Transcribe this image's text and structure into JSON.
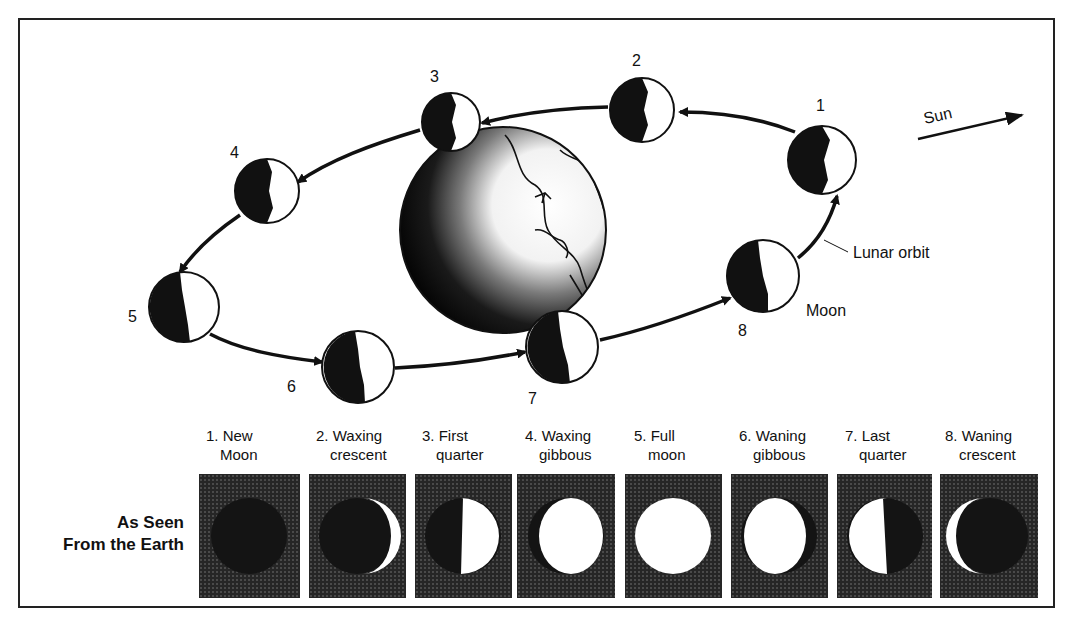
{
  "diagram": {
    "sun_label": "Sun",
    "lunar_orbit_label": "Lunar orbit",
    "moon_label": "Moon",
    "earth_label": "",
    "orbit_positions": [
      {
        "n": "1",
        "cx": 822,
        "cy": 160
      },
      {
        "n": "2",
        "cx": 642,
        "cy": 110
      },
      {
        "n": "3",
        "cx": 451,
        "cy": 122
      },
      {
        "n": "4",
        "cx": 267,
        "cy": 191
      },
      {
        "n": "5",
        "cx": 184,
        "cy": 307
      },
      {
        "n": "6",
        "cx": 358,
        "cy": 367
      },
      {
        "n": "7",
        "cx": 562,
        "cy": 347
      },
      {
        "n": "8",
        "cx": 763,
        "cy": 276
      }
    ]
  },
  "phases_section": {
    "side_label_line1": "As Seen",
    "side_label_line2": "From the Earth",
    "phases": [
      {
        "num": "1.",
        "line1": "New",
        "line2": "Moon"
      },
      {
        "num": "2.",
        "line1": "Waxing",
        "line2": "crescent"
      },
      {
        "num": "3.",
        "line1": "First",
        "line2": "quarter"
      },
      {
        "num": "4.",
        "line1": "Waxing",
        "line2": "gibbous"
      },
      {
        "num": "5.",
        "line1": "Full",
        "line2": "moon"
      },
      {
        "num": "6.",
        "line1": "Waning",
        "line2": "gibbous"
      },
      {
        "num": "7.",
        "line1": "Last",
        "line2": "quarter"
      },
      {
        "num": "8.",
        "line1": "Waning",
        "line2": "crescent"
      }
    ]
  },
  "colors": {
    "ink": "#111111",
    "panel_bg": "#262626",
    "lit": "#ffffff"
  }
}
